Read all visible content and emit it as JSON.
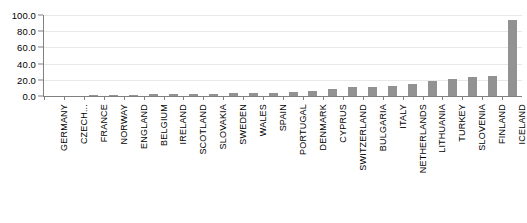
{
  "chart_data": {
    "type": "bar",
    "title": "",
    "subtitle": "",
    "xlabel": "",
    "ylabel": "",
    "ylim": [
      0.0,
      100.0
    ],
    "yticks": [
      "0.0",
      "20.0",
      "40.0",
      "60.0",
      "80.0",
      "100.0"
    ],
    "ytick_values": [
      0.0,
      20.0,
      40.0,
      60.0,
      80.0,
      100.0
    ],
    "grid": true,
    "legend": "none",
    "bar_color": "#929292",
    "axis_color": "#808080",
    "gridline_color": "#e8e8e8",
    "categories": [
      "GERMANY",
      "CZECH...",
      "FRANCE",
      "NORWAY",
      "ENGLAND",
      "BELGIUM",
      "IRELAND",
      "SCOTLAND",
      "SLOVAKIA",
      "SWEDEN",
      "WALES",
      "SPAIN",
      "PORTUGAL",
      "DENMARK",
      "CYPRUS",
      "SWITZERLAND",
      "BULGARIA",
      "ITALY",
      "NETHERLANDS",
      "LITHUANIA",
      "TURKEY",
      "SLOVENIA",
      "FINLAND",
      "ICELAND"
    ],
    "values": [
      0.4,
      0.6,
      1.0,
      1.3,
      1.6,
      2.0,
      2.4,
      2.8,
      3.1,
      3.5,
      3.9,
      4.3,
      5.4,
      6.6,
      8.2,
      11.0,
      11.6,
      12.0,
      14.5,
      19.0,
      21.0,
      24.0,
      24.5,
      94.0
    ]
  }
}
